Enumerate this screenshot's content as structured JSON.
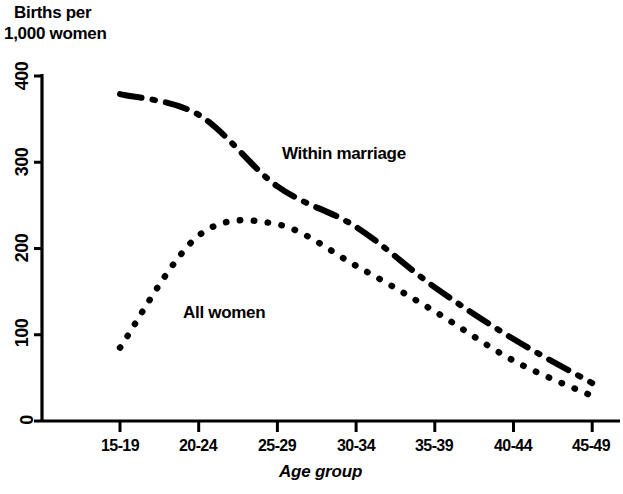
{
  "chart_data": {
    "type": "line",
    "title": "Births per 1,000 women",
    "title_line1": "Births per",
    "title_line2": "1,000 women",
    "xlabel": "Age group",
    "ylabel": "Births per 1,000 women",
    "categories": [
      "15-19",
      "20-24",
      "25-29",
      "30-34",
      "35-39",
      "40-44",
      "45-49"
    ],
    "ylim": [
      0,
      400
    ],
    "yticks": [
      "0",
      "100",
      "200",
      "300",
      "400"
    ],
    "ytick_values": [
      0,
      100,
      200,
      300,
      400
    ],
    "grid": false,
    "legend_position": "inline-annotation",
    "series": [
      {
        "name": "Within marriage",
        "style": "dash-dot",
        "color": "#000000",
        "values": [
          379,
          355,
          272,
          225,
          155,
          95,
          44
        ]
      },
      {
        "name": "All women",
        "style": "dotted",
        "color": "#000000",
        "values": [
          85,
          215,
          228,
          180,
          127,
          70,
          29
        ]
      }
    ],
    "annotations": [
      {
        "text": "Within marriage",
        "series": "Within marriage"
      },
      {
        "text": "All women",
        "series": "All women"
      }
    ]
  },
  "axes": {
    "x_tick_labels": [
      "15-19",
      "20-24",
      "25-29",
      "30-34",
      "35-39",
      "40-44",
      "45-49"
    ],
    "y_tick_labels": [
      "0",
      "100",
      "200",
      "300",
      "400"
    ]
  }
}
